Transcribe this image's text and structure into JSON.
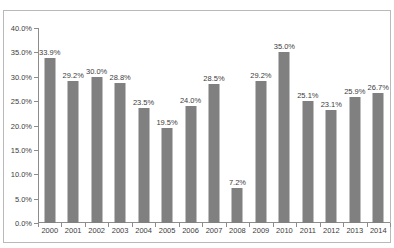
{
  "chart_data": {
    "type": "bar",
    "title": "",
    "xlabel": "",
    "ylabel": "",
    "ylim": [
      0,
      40
    ],
    "ytick_labels": [
      "0.0%",
      "5.0%",
      "10.0%",
      "15.0%",
      "20.0%",
      "25.0%",
      "30.0%",
      "35.0%",
      "40.0%"
    ],
    "ytick_values": [
      0,
      5,
      10,
      15,
      20,
      25,
      30,
      35,
      40
    ],
    "grid": false,
    "legend": "none",
    "bar_color": "#808080",
    "categories": [
      "2000",
      "2001",
      "2002",
      "2003",
      "2004",
      "2005",
      "2006",
      "2007",
      "2008",
      "2009",
      "2010",
      "2011",
      "2012",
      "2013",
      "2014"
    ],
    "values": [
      33.9,
      29.2,
      30.0,
      28.8,
      23.5,
      19.5,
      24.0,
      28.5,
      7.2,
      29.2,
      35.0,
      25.1,
      23.1,
      25.9,
      26.7
    ],
    "data_labels": [
      "33.9%",
      "29.2%",
      "30.0%",
      "28.8%",
      "23.5%",
      "19.5%",
      "24.0%",
      "28.5%",
      "7.2%",
      "29.2%",
      "35.0%",
      "25.1%",
      "23.1%",
      "25.9%",
      "26.7%"
    ]
  }
}
